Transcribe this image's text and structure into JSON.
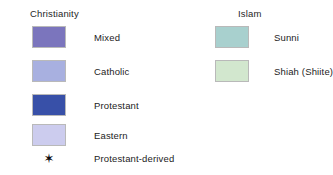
{
  "legend": {
    "background_color": "#ffffff",
    "groups": [
      {
        "title": "Christianity",
        "entries": [
          {
            "label": "Mixed",
            "color": "#7b75bd"
          },
          {
            "label": "Catholic",
            "color": "#a8b0e0"
          },
          {
            "label": "Protestant",
            "color": "#3850a8"
          },
          {
            "label": "Eastern",
            "color": "#ccccee"
          }
        ]
      },
      {
        "title": "Islam",
        "entries": [
          {
            "label": "Sunni",
            "color": "#a8d0ce"
          },
          {
            "label": "Shiah (Shiite)",
            "color": "#d2e7ce"
          }
        ]
      }
    ],
    "note": {
      "marker": "✶",
      "label": "Protestant-derived"
    }
  }
}
